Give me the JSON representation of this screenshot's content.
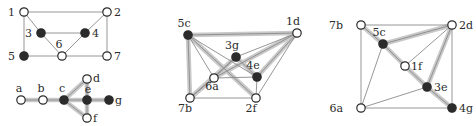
{
  "figure": {
    "title": "",
    "background_color": "#ffffff",
    "edge_color": "#8a8a8a",
    "highlight_edge_color": "#c9c9c9",
    "filled_node_color": "#2b2b2b",
    "open_node_fill": "#ffffff",
    "open_node_stroke": "#2b2b2b",
    "label_color": "#2b2b2b",
    "node_radius": 4.2,
    "edge_width": 0.9,
    "highlight_width": 4.5
  },
  "graphs": [
    {
      "id": "graph-1-top",
      "name": "graph-upper-left",
      "nodes": [
        {
          "id": "1",
          "label": "1",
          "x": 24,
          "y": 12,
          "filled": false,
          "label_dx": -9,
          "label_dy": 4
        },
        {
          "id": "2",
          "label": "2",
          "x": 107,
          "y": 12,
          "filled": false,
          "label_dx": 7,
          "label_dy": 4
        },
        {
          "id": "3",
          "label": "3",
          "x": 41,
          "y": 33,
          "filled": true,
          "label_dx": -9,
          "label_dy": 4
        },
        {
          "id": "4",
          "label": "4",
          "x": 85,
          "y": 33,
          "filled": true,
          "label_dx": 7,
          "label_dy": 4
        },
        {
          "id": "5",
          "label": "5",
          "x": 24,
          "y": 56,
          "filled": true,
          "label_dx": -9,
          "label_dy": 4
        },
        {
          "id": "6",
          "label": "6",
          "x": 62,
          "y": 56,
          "filled": false,
          "label_dx": -3,
          "label_dy": -8
        },
        {
          "id": "7",
          "label": "7",
          "x": 107,
          "y": 56,
          "filled": false,
          "label_dx": 7,
          "label_dy": 4
        }
      ],
      "edges": [
        {
          "from": "1",
          "to": "2",
          "highlight": false
        },
        {
          "from": "1",
          "to": "3",
          "highlight": false
        },
        {
          "from": "1",
          "to": "5",
          "highlight": false
        },
        {
          "from": "3",
          "to": "4",
          "highlight": false
        },
        {
          "from": "3",
          "to": "6",
          "highlight": false
        },
        {
          "from": "4",
          "to": "2",
          "highlight": false
        },
        {
          "from": "4",
          "to": "6",
          "highlight": false
        },
        {
          "from": "2",
          "to": "7",
          "highlight": false
        },
        {
          "from": "5",
          "to": "6",
          "highlight": false
        },
        {
          "from": "6",
          "to": "7",
          "highlight": false
        }
      ]
    },
    {
      "id": "graph-1-bottom",
      "name": "graph-lower-left",
      "nodes": [
        {
          "id": "a",
          "label": "a",
          "x": 21,
          "y": 100,
          "filled": false,
          "label_dx": -2,
          "label_dy": -8
        },
        {
          "id": "b",
          "label": "b",
          "x": 43,
          "y": 100,
          "filled": false,
          "label_dx": -2,
          "label_dy": -8
        },
        {
          "id": "c",
          "label": "c",
          "x": 64,
          "y": 100,
          "filled": true,
          "label_dx": -2,
          "label_dy": -8
        },
        {
          "id": "d",
          "label": "d",
          "x": 87,
          "y": 79,
          "filled": false,
          "label_dx": 6,
          "label_dy": 3
        },
        {
          "id": "e",
          "label": "e",
          "x": 87,
          "y": 100,
          "filled": true,
          "label_dx": 1,
          "label_dy": -7
        },
        {
          "id": "f",
          "label": "f",
          "x": 87,
          "y": 118,
          "filled": false,
          "label_dx": 6,
          "label_dy": 4
        },
        {
          "id": "g",
          "label": "g",
          "x": 109,
          "y": 100,
          "filled": true,
          "label_dx": 6,
          "label_dy": 4
        }
      ],
      "edges": [
        {
          "from": "a",
          "to": "b",
          "highlight": true
        },
        {
          "from": "b",
          "to": "c",
          "highlight": true
        },
        {
          "from": "c",
          "to": "d",
          "highlight": true
        },
        {
          "from": "c",
          "to": "e",
          "highlight": true
        },
        {
          "from": "c",
          "to": "f",
          "highlight": true
        },
        {
          "from": "d",
          "to": "e",
          "highlight": true
        },
        {
          "from": "e",
          "to": "f",
          "highlight": true
        },
        {
          "from": "e",
          "to": "g",
          "highlight": true
        }
      ]
    },
    {
      "id": "graph-2",
      "name": "graph-middle",
      "nodes": [
        {
          "id": "5c",
          "label": "5c",
          "x": 188,
          "y": 35,
          "filled": true,
          "label_dx": -4,
          "label_dy": -8
        },
        {
          "id": "1d",
          "label": "1d",
          "x": 297,
          "y": 33,
          "filled": false,
          "label_dx": -4,
          "label_dy": -8
        },
        {
          "id": "3g",
          "label": "3g",
          "x": 236,
          "y": 57,
          "filled": true,
          "label_dx": -4,
          "label_dy": -8
        },
        {
          "id": "4e",
          "label": "4e",
          "x": 257,
          "y": 77,
          "filled": true,
          "label_dx": -4,
          "label_dy": -8
        },
        {
          "id": "6a",
          "label": "6a",
          "x": 214,
          "y": 78,
          "filled": false,
          "label_dx": -2,
          "label_dy": 12
        },
        {
          "id": "7b",
          "label": "7b",
          "x": 190,
          "y": 98,
          "filled": false,
          "label_dx": -5,
          "label_dy": 14
        },
        {
          "id": "2f",
          "label": "2f",
          "x": 256,
          "y": 98,
          "filled": false,
          "label_dx": -5,
          "label_dy": 14
        }
      ],
      "edges": [
        {
          "from": "5c",
          "to": "1d",
          "highlight": true
        },
        {
          "from": "5c",
          "to": "7b",
          "highlight": true
        },
        {
          "from": "5c",
          "to": "6a",
          "highlight": false
        },
        {
          "from": "5c",
          "to": "2f",
          "highlight": true
        },
        {
          "from": "5c",
          "to": "4e",
          "highlight": false
        },
        {
          "from": "1d",
          "to": "3g",
          "highlight": false
        },
        {
          "from": "1d",
          "to": "4e",
          "highlight": true
        },
        {
          "from": "1d",
          "to": "2f",
          "highlight": false
        },
        {
          "from": "1d",
          "to": "6a",
          "highlight": true
        },
        {
          "from": "3g",
          "to": "6a",
          "highlight": false
        },
        {
          "from": "3g",
          "to": "4e",
          "highlight": true
        },
        {
          "from": "3g",
          "to": "7b",
          "highlight": true
        },
        {
          "from": "4e",
          "to": "2f",
          "highlight": false
        },
        {
          "from": "6a",
          "to": "4e",
          "highlight": false
        },
        {
          "from": "6a",
          "to": "7b",
          "highlight": true
        },
        {
          "from": "7b",
          "to": "2f",
          "highlight": false
        }
      ]
    },
    {
      "id": "graph-3",
      "name": "graph-right",
      "nodes": [
        {
          "id": "7b",
          "label": "7b",
          "x": 361,
          "y": 25,
          "filled": false,
          "label_dx": -18,
          "label_dy": 4
        },
        {
          "id": "2d",
          "label": "2d",
          "x": 452,
          "y": 25,
          "filled": false,
          "label_dx": 7,
          "label_dy": 4
        },
        {
          "id": "5c",
          "label": "5c",
          "x": 383,
          "y": 44,
          "filled": true,
          "label_dx": -4,
          "label_dy": -8
        },
        {
          "id": "1f",
          "label": "1f",
          "x": 405,
          "y": 66,
          "filled": false,
          "label_dx": 6,
          "label_dy": 4
        },
        {
          "id": "3e",
          "label": "3e",
          "x": 427,
          "y": 87,
          "filled": true,
          "label_dx": 7,
          "label_dy": 4
        },
        {
          "id": "6a",
          "label": "6a",
          "x": 361,
          "y": 108,
          "filled": false,
          "label_dx": -18,
          "label_dy": 4
        },
        {
          "id": "4g",
          "label": "4g",
          "x": 452,
          "y": 108,
          "filled": true,
          "label_dx": 7,
          "label_dy": 4
        }
      ],
      "edges": [
        {
          "from": "7b",
          "to": "2d",
          "highlight": false
        },
        {
          "from": "7b",
          "to": "5c",
          "highlight": true
        },
        {
          "from": "7b",
          "to": "6a",
          "highlight": false
        },
        {
          "from": "5c",
          "to": "2d",
          "highlight": true
        },
        {
          "from": "5c",
          "to": "1f",
          "highlight": true
        },
        {
          "from": "5c",
          "to": "6a",
          "highlight": false
        },
        {
          "from": "2d",
          "to": "1f",
          "highlight": false
        },
        {
          "from": "2d",
          "to": "3e",
          "highlight": true
        },
        {
          "from": "2d",
          "to": "4g",
          "highlight": false
        },
        {
          "from": "1f",
          "to": "3e",
          "highlight": true
        },
        {
          "from": "3e",
          "to": "6a",
          "highlight": false
        },
        {
          "from": "3e",
          "to": "4g",
          "highlight": true
        },
        {
          "from": "6a",
          "to": "4g",
          "highlight": false
        }
      ]
    }
  ]
}
